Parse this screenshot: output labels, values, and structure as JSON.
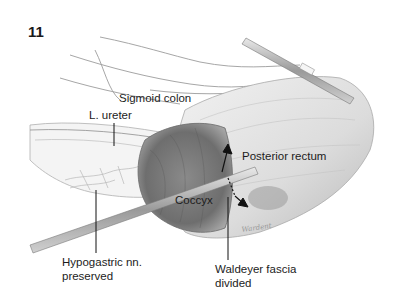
{
  "figure": {
    "number": "11",
    "labels": {
      "sigmoid_colon": "Sigmoid colon",
      "l_ureter": "L. ureter",
      "posterior_rectum": "Posterior rectum",
      "coccyx": "Coccyx",
      "hypogastric_line1": "Hypogastric nn.",
      "hypogastric_line2": "preserved",
      "waldeyer_line1": "Waldeyer fascia",
      "waldeyer_line2": "divided"
    },
    "signature": "Wardent"
  }
}
